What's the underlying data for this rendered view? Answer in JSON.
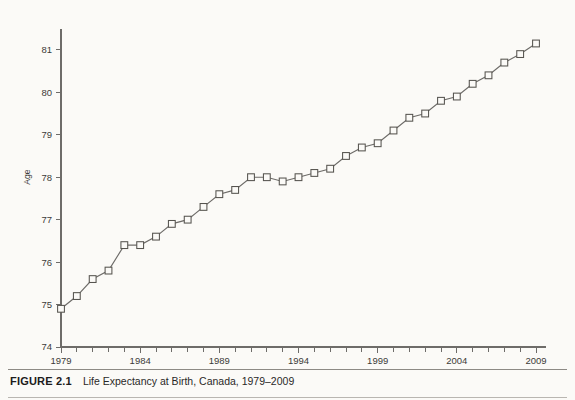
{
  "caption": {
    "figure_number": "FIGURE 2.1",
    "title": "Life Expectancy at Birth, Canada, 1979–2009"
  },
  "chart_data": {
    "type": "line",
    "title": "Life Expectancy at Birth, Canada, 1979–2009",
    "xlabel": "",
    "ylabel": "Age",
    "xlim": [
      1979,
      2009
    ],
    "ylim": [
      74,
      81.5
    ],
    "y_ticks": [
      74,
      75,
      76,
      77,
      78,
      79,
      80,
      81
    ],
    "y_tick_labels": [
      "74",
      "75",
      "76",
      "77",
      "78",
      "79",
      "80",
      "81"
    ],
    "x_ticks": [
      1979,
      1984,
      1989,
      1994,
      1999,
      2004,
      2009
    ],
    "x_tick_labels": [
      "1979",
      "1984",
      "1989",
      "1994",
      "1999",
      "2004",
      "2009"
    ],
    "x_minor_tick_step": 1,
    "grid": false,
    "legend": null,
    "marker": "square",
    "line_color": "#6d6b68",
    "marker_edge_color": "#56544f",
    "marker_face_color": "#fbfaf7",
    "x": [
      1979,
      1980,
      1981,
      1982,
      1983,
      1984,
      1985,
      1986,
      1987,
      1988,
      1989,
      1990,
      1991,
      1992,
      1993,
      1994,
      1995,
      1996,
      1997,
      1998,
      1999,
      2000,
      2001,
      2002,
      2003,
      2004,
      2005,
      2006,
      2007,
      2008,
      2009
    ],
    "values": [
      74.9,
      75.2,
      75.6,
      75.8,
      76.4,
      76.4,
      76.6,
      76.9,
      77.0,
      77.3,
      77.6,
      77.7,
      78.0,
      78.0,
      77.9,
      78.0,
      78.1,
      78.2,
      78.5,
      78.7,
      78.8,
      79.1,
      79.4,
      79.5,
      79.8,
      79.9,
      80.2,
      80.4,
      80.7,
      80.9,
      81.15
    ],
    "series": [
      {
        "name": "Life expectancy at birth",
        "values": [
          74.9,
          75.2,
          75.6,
          75.8,
          76.4,
          76.4,
          76.6,
          76.9,
          77.0,
          77.3,
          77.6,
          77.7,
          78.0,
          78.0,
          77.9,
          78.0,
          78.1,
          78.2,
          78.5,
          78.7,
          78.8,
          79.1,
          79.4,
          79.5,
          79.8,
          79.9,
          80.2,
          80.4,
          80.7,
          80.9,
          81.15
        ]
      }
    ]
  }
}
